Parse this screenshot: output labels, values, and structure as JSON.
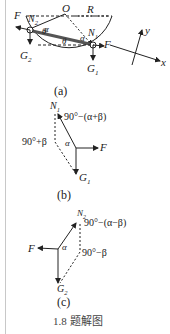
{
  "figure_a": {
    "labels": {
      "F_left": "F",
      "N2": "N",
      "N2_sub": "2",
      "O": "O",
      "R": "R",
      "N1": "N",
      "N1_sub": "1",
      "alpha1": "α",
      "alpha2": "α",
      "theta1": "θ",
      "theta2": "θ",
      "F_right": "F",
      "G2": "G",
      "G2_sub": "2",
      "G1": "G",
      "G1_sub": "1",
      "y": "y",
      "x": "x"
    },
    "caption": "(a)"
  },
  "figure_b": {
    "labels": {
      "N1": "N",
      "N1_sub": "1",
      "angle_top": "90°−(α+β)",
      "angle_left": "90°+β",
      "alpha": "α",
      "F": "F",
      "G1": "G",
      "G1_sub": "1"
    },
    "caption": "(b)"
  },
  "figure_c": {
    "labels": {
      "N2": "N",
      "N2_sub": "2",
      "angle_top": "90°−(α−β)",
      "F": "F",
      "alpha": "α",
      "angle_right": "90°−β",
      "G2": "G",
      "G2_sub": "2"
    },
    "caption": "(c)"
  },
  "figure_title": "1.8 题解图"
}
